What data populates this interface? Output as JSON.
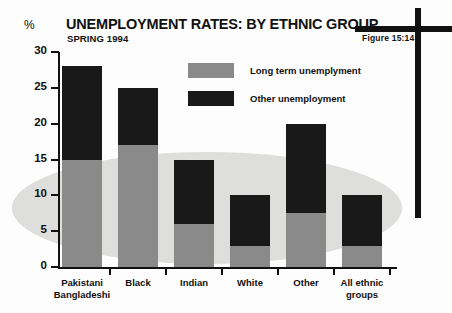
{
  "figure": {
    "tag": "Figure 15:14",
    "title": "UNEMPLOYMENT RATES: BY ETHNIC GROUP",
    "subtitle": "SPRING 1994",
    "unit_label": "%"
  },
  "legend": {
    "items": [
      {
        "label": "Long term unemplyment",
        "color": "#8a8a8a",
        "key": "long_term"
      },
      {
        "label": "Other unemployment",
        "color": "#191919",
        "key": "other"
      }
    ]
  },
  "axes": {
    "y_ticks": [
      "0",
      "5",
      "10",
      "15",
      "20",
      "25",
      "30"
    ],
    "x_labels": [
      {
        "line1": "Pakistani",
        "line2": "Bangladeshi"
      },
      {
        "line1": "Black",
        "line2": ""
      },
      {
        "line1": "Indian",
        "line2": ""
      },
      {
        "line1": "White",
        "line2": ""
      },
      {
        "line1": "Other",
        "line2": ""
      },
      {
        "line1": "All ethnic",
        "line2": "groups"
      }
    ]
  },
  "chart_data": {
    "type": "bar",
    "stacked": true,
    "title": "UNEMPLOYMENT RATES: BY ETHNIC GROUP",
    "subtitle": "SPRING 1994",
    "xlabel": "",
    "ylabel": "%",
    "ylim": [
      0,
      30
    ],
    "yticks": [
      0,
      5,
      10,
      15,
      20,
      25,
      30
    ],
    "grid": false,
    "legend_position": "top-center",
    "categories": [
      "Pakistani Bangladeshi",
      "Black",
      "Indian",
      "White",
      "Other",
      "All ethnic groups"
    ],
    "series": [
      {
        "name": "Long term unemplyment",
        "color": "#8a8a8a",
        "values": [
          15,
          17,
          6,
          3,
          7.5,
          3
        ]
      },
      {
        "name": "Other unemployment",
        "color": "#191919",
        "values": [
          13,
          8,
          9,
          7,
          12.5,
          7
        ]
      }
    ],
    "totals": [
      28,
      25,
      15,
      10,
      20,
      10
    ]
  }
}
